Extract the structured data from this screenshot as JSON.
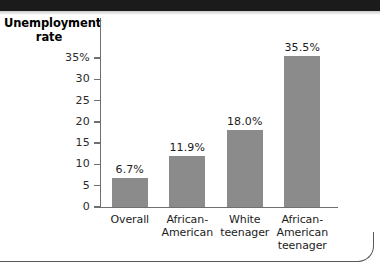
{
  "figure": {
    "background_color": "#ffffff",
    "band_color": "#1b1b1b",
    "rule_color": "#55595c"
  },
  "chart_data": {
    "type": "bar",
    "title": "",
    "xlabel": "",
    "ylabel": "Unemployment rate",
    "ylabel_line1": "Unemployment",
    "ylabel_line2": "rate",
    "categories": [
      "Overall",
      "African-American",
      "White teenager",
      "African-American teenager"
    ],
    "category_lines": [
      [
        "Overall"
      ],
      [
        "African-",
        "American"
      ],
      [
        "White",
        "teenager"
      ],
      [
        "African-",
        "American",
        "teenager"
      ]
    ],
    "values": [
      6.7,
      11.9,
      18.0,
      35.5
    ],
    "value_labels": [
      "6.7%",
      "11.9%",
      "18.0%",
      "35.5%"
    ],
    "ylim": [
      0,
      36.5
    ],
    "yticks": [
      0,
      5,
      10,
      15,
      20,
      25,
      30,
      35
    ],
    "ytick_labels": [
      "0",
      "5",
      "10",
      "15",
      "20",
      "25",
      "30",
      "35%"
    ],
    "grid": false,
    "legend": null,
    "bar_color": "#8b8b8b",
    "axis_color": "#6c7073",
    "text_color": "#1c1c1c"
  }
}
